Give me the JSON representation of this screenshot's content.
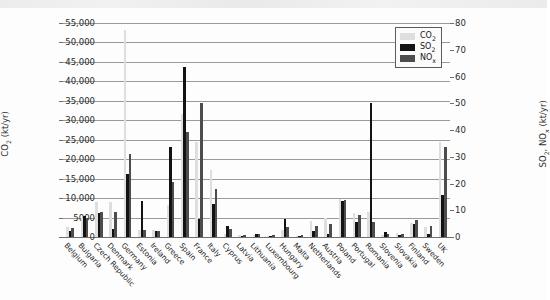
{
  "chart_data": {
    "type": "bar",
    "title": "",
    "subtitle": "",
    "xlabel": "",
    "ylabel": "CO2 (kt/yr)",
    "ylabel_right": "SO2, NOx (kt/yr)",
    "ylim": [
      0,
      55000
    ],
    "ylim_right": [
      0,
      80
    ],
    "yticks": [
      "0",
      "5000",
      "10,000",
      "15,000",
      "20,000",
      "25,000",
      "30,000",
      "35,000",
      "40,000",
      "45,000",
      "50,000",
      "55,000"
    ],
    "ytick_values": [
      0,
      5000,
      10000,
      15000,
      20000,
      25000,
      30000,
      35000,
      40000,
      45000,
      50000,
      55000
    ],
    "yticks_right": [
      "0",
      "10",
      "20",
      "30",
      "40",
      "50",
      "60",
      "70",
      "80"
    ],
    "ytick_values_right": [
      0,
      10,
      20,
      30,
      40,
      50,
      60,
      70,
      80
    ],
    "grid": true,
    "legend_position": "top-right",
    "categories": [
      "Belgium",
      "Bulgaria",
      "Czech Republic",
      "Denmark",
      "Germany",
      "Estonia",
      "Ireland",
      "Greece",
      "Spain",
      "France",
      "Italy",
      "Cyprus",
      "Latvia",
      "Lithuania",
      "Luxembourg",
      "Hungary",
      "Malta",
      "Netherlands",
      "Austria",
      "Poland",
      "Portugal",
      "Romania",
      "Slovenia",
      "Slovakia",
      "Finland",
      "Sweden",
      "UK"
    ],
    "series": [
      {
        "name": "CO2",
        "unit": "kt/yr",
        "axis": "left",
        "color": "#dededf",
        "values": [
          2600,
          4800,
          8900,
          9000,
          53200,
          1900,
          1700,
          8200,
          31500,
          24500,
          17300,
          700,
          400,
          500,
          350,
          1700,
          250,
          4200,
          4800,
          9700,
          6100,
          6400,
          600,
          1000,
          3600,
          2600,
          24500
        ]
      },
      {
        "name": "SO2",
        "unit": "kt/yr",
        "axis": "right",
        "color": "#131313",
        "values": [
          2.1,
          7.7,
          9.0,
          2.9,
          23.4,
          13.5,
          2.2,
          33.6,
          63.7,
          6.6,
          12.3,
          4.1,
          0.5,
          1.3,
          0.3,
          6.7,
          0.5,
          2.2,
          1.2,
          13.4,
          5.6,
          50.0,
          1.8,
          0.6,
          4.7,
          1.2,
          15.6
        ]
      },
      {
        "name": "NOx",
        "unit": "kt/yr",
        "axis": "right",
        "color": "#4d4d4d",
        "values": [
          3.3,
          7.1,
          9.2,
          9.5,
          31.2,
          2.6,
          2.3,
          20.5,
          39.2,
          50.0,
          18.1,
          3.0,
          0.7,
          1.1,
          0.6,
          3.8,
          0.8,
          4.0,
          5.0,
          13.7,
          8.1,
          5.7,
          1.0,
          1.1,
          6.4,
          4.3,
          33.6
        ]
      }
    ],
    "legend": [
      {
        "label": "CO",
        "sub": "2",
        "key": "co2",
        "color": "#dededf"
      },
      {
        "label": "SO",
        "sub": "2",
        "key": "so2",
        "color": "#131313"
      },
      {
        "label": "NO",
        "sub": "x",
        "key": "nox",
        "color": "#4d4d4d"
      }
    ],
    "axis_titles": {
      "left_main": "CO",
      "left_sub": "2",
      "left_tail": " (kt/yr)",
      "right_main_a": "SO",
      "right_sub_a": "2",
      "right_mid": ", NO",
      "right_sub_b": "x",
      "right_tail": " (kt/yr)"
    }
  }
}
